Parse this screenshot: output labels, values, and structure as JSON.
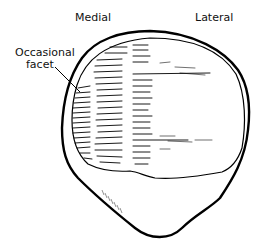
{
  "diagram": {
    "labels": {
      "medial": "Medial",
      "lateral": "Lateral",
      "occasional_facet_line1": "Occasional",
      "occasional_facet_line2": "facet"
    },
    "colors": {
      "line": "#000000",
      "background": "#ffffff"
    }
  }
}
